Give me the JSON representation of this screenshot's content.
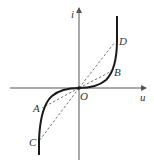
{
  "diagram": {
    "axes": {
      "x_label": "u",
      "y_label": "i",
      "origin_label": "O"
    },
    "points": [
      {
        "name": "A",
        "label": "A"
      },
      {
        "name": "B",
        "label": "B"
      },
      {
        "name": "C",
        "label": "C"
      },
      {
        "name": "D",
        "label": "D"
      }
    ],
    "colors": {
      "axis": "#555555",
      "curve": "#1a1a1a",
      "dashed": "#666666",
      "text": "#333333"
    }
  }
}
